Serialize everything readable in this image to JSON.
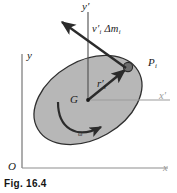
{
  "figure": {
    "caption": "Fig. 16.4",
    "background_color": "#ffffff",
    "body_fill_color": "#b7b7b7",
    "body_stroke_color": "#2b2b2b",
    "vector_color": "#2b2b2b",
    "axis_color": "#5a5a5a",
    "faint_axis_color": "#a8a8a8",
    "point_color": "#6e6e6e"
  },
  "labels": {
    "y_prime_axis": "y",
    "y_prime_mark": "′",
    "x_prime_axis": "x",
    "x_prime_mark": "′",
    "y_axis": "y",
    "x_axis": "x",
    "origin": "O",
    "center_of_mass": "G",
    "particle": "P",
    "particle_sub": "i",
    "momentum_vector": "v",
    "momentum_prime": "′",
    "momentum_sub": "i",
    "momentum_delta": "Δm",
    "momentum_delta_sub": "i",
    "position_vector": "r",
    "position_prime": "′",
    "position_sub": "i",
    "angular_velocity": "ω"
  }
}
